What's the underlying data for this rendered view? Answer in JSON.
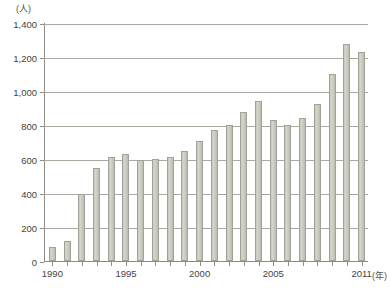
{
  "chart_data": {
    "type": "bar",
    "title": "",
    "xlabel": "年",
    "ylabel": "(人)",
    "y_unit_label": "(人)",
    "x_unit_label": "(年)",
    "ylim": [
      0,
      1400
    ],
    "ytick_step": 200,
    "ytick_labels": [
      "1,400",
      "1,200",
      "1,000",
      "800",
      "600",
      "400",
      "200",
      "0"
    ],
    "ytick_values": [
      1400,
      1200,
      1000,
      800,
      600,
      400,
      200,
      0
    ],
    "xtick_labels": [
      "1990",
      "1995",
      "2000",
      "2005",
      "2011"
    ],
    "xtick_years": [
      1990,
      1995,
      2000,
      2005,
      2011
    ],
    "grid": true,
    "legend": "none",
    "bar_color": "#cbcac1",
    "bar_edge_color": "#a3a298",
    "axis_color": "#8c8c84",
    "grid_color": "#a9a9a0",
    "categories": [
      1990,
      1991,
      1992,
      1993,
      1994,
      1995,
      1996,
      1997,
      1998,
      1999,
      2000,
      2001,
      2002,
      2003,
      2004,
      2005,
      2006,
      2007,
      2008,
      2009,
      2010,
      2011
    ],
    "values": [
      80,
      115,
      395,
      550,
      610,
      630,
      595,
      600,
      610,
      650,
      705,
      770,
      800,
      875,
      940,
      830,
      800,
      840,
      925,
      1100,
      1275,
      1230
    ]
  },
  "caption": {
    "text": ""
  }
}
